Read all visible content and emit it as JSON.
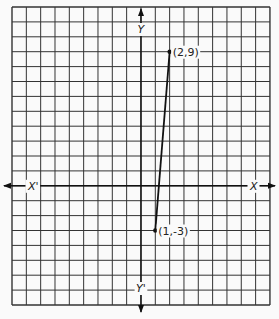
{
  "chart_data": {
    "type": "line",
    "title": "",
    "xlabel": "X",
    "xlabel_neg": "X'",
    "ylabel": "Y",
    "ylabel_neg": "Y'",
    "grid": true,
    "xlim": [
      -9,
      9
    ],
    "ylim": [
      -8,
      12
    ],
    "series": [
      {
        "name": "segment",
        "x": [
          1,
          2
        ],
        "y": [
          -3,
          9
        ]
      }
    ],
    "points": [
      {
        "x": 2,
        "y": 9,
        "label": "(2,9)"
      },
      {
        "x": 1,
        "y": -3,
        "label": "(1,-3)"
      }
    ]
  }
}
